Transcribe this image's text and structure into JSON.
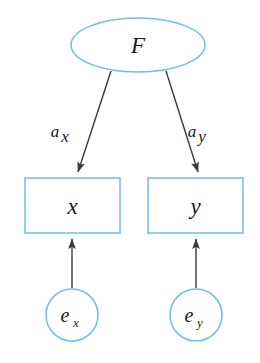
{
  "diagram": {
    "type": "path-diagram",
    "title": "",
    "colors": {
      "shape_stroke": "#74bede",
      "arrow_stroke": "#3a3a3a",
      "text": "#1a1a1a",
      "background": "#ffffff"
    },
    "nodes": [
      {
        "id": "F",
        "shape": "ellipse",
        "label": "F",
        "subscript": "",
        "cx": 138,
        "cy": 45,
        "rx": 67,
        "ry": 27
      },
      {
        "id": "x",
        "shape": "rect",
        "label": "x",
        "subscript": "",
        "x": 25,
        "y": 178,
        "width": 95,
        "height": 55
      },
      {
        "id": "y",
        "shape": "rect",
        "label": "y",
        "subscript": "",
        "x": 148,
        "y": 178,
        "width": 95,
        "height": 55
      },
      {
        "id": "ex",
        "shape": "circle",
        "label": "e",
        "subscript": "x",
        "cx": 72,
        "cy": 315,
        "r": 26
      },
      {
        "id": "ey",
        "shape": "circle",
        "label": "e",
        "subscript": "y",
        "cx": 196,
        "cy": 315,
        "r": 26
      }
    ],
    "edges": [
      {
        "id": "F-to-x",
        "from": "F",
        "to": "x",
        "label": "a",
        "subscript": "x",
        "label_x": 55,
        "label_y": 137,
        "x1": 111,
        "y1": 71,
        "x2": 78,
        "y2": 172
      },
      {
        "id": "F-to-y",
        "from": "F",
        "to": "y",
        "label": "a",
        "subscript": "y",
        "label_x": 192,
        "label_y": 137,
        "x1": 166,
        "y1": 71,
        "x2": 198,
        "y2": 172
      },
      {
        "id": "ex-to-x",
        "from": "ex",
        "to": "x",
        "label": "",
        "subscript": "",
        "x1": 72,
        "y1": 288,
        "x2": 72,
        "y2": 239
      },
      {
        "id": "ey-to-y",
        "from": "ey",
        "to": "y",
        "label": "",
        "subscript": "",
        "x1": 196,
        "y1": 288,
        "x2": 196,
        "y2": 239
      }
    ]
  }
}
